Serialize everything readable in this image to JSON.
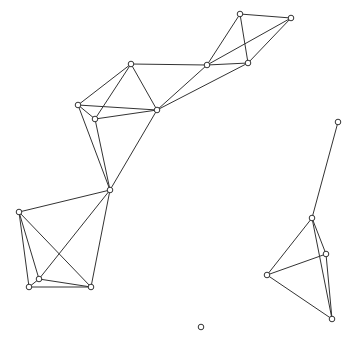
{
  "diagram": {
    "type": "network-graph",
    "colors": {
      "edge": "#333333",
      "node_fill": "#ffffff",
      "node_stroke": "#333333",
      "background": "#ffffff"
    },
    "nodes": [
      {
        "id": 0,
        "x": 240,
        "y": 14
      },
      {
        "id": 1,
        "x": 291,
        "y": 18
      },
      {
        "id": 2,
        "x": 207,
        "y": 65
      },
      {
        "id": 3,
        "x": 248,
        "y": 63
      },
      {
        "id": 4,
        "x": 131,
        "y": 64
      },
      {
        "id": 5,
        "x": 78,
        "y": 105
      },
      {
        "id": 6,
        "x": 95,
        "y": 119
      },
      {
        "id": 7,
        "x": 157,
        "y": 110
      },
      {
        "id": 8,
        "x": 110,
        "y": 190
      },
      {
        "id": 9,
        "x": 19,
        "y": 212
      },
      {
        "id": 10,
        "x": 39,
        "y": 279
      },
      {
        "id": 11,
        "x": 29,
        "y": 287
      },
      {
        "id": 12,
        "x": 91,
        "y": 287
      },
      {
        "id": 13,
        "x": 338,
        "y": 122
      },
      {
        "id": 14,
        "x": 312,
        "y": 218
      },
      {
        "id": 15,
        "x": 326,
        "y": 254
      },
      {
        "id": 16,
        "x": 267,
        "y": 275
      },
      {
        "id": 17,
        "x": 332,
        "y": 319
      },
      {
        "id": 18,
        "x": 201,
        "y": 327
      }
    ],
    "edges": [
      [
        0,
        1
      ],
      [
        0,
        2
      ],
      [
        0,
        3
      ],
      [
        1,
        2
      ],
      [
        1,
        3
      ],
      [
        2,
        3
      ],
      [
        2,
        4
      ],
      [
        2,
        7
      ],
      [
        3,
        7
      ],
      [
        4,
        5
      ],
      [
        4,
        6
      ],
      [
        4,
        7
      ],
      [
        5,
        7
      ],
      [
        6,
        7
      ],
      [
        5,
        6
      ],
      [
        5,
        8
      ],
      [
        6,
        8
      ],
      [
        7,
        8
      ],
      [
        8,
        9
      ],
      [
        8,
        10
      ],
      [
        8,
        12
      ],
      [
        9,
        10
      ],
      [
        9,
        11
      ],
      [
        9,
        12
      ],
      [
        10,
        11
      ],
      [
        10,
        12
      ],
      [
        11,
        12
      ],
      [
        13,
        14
      ],
      [
        14,
        15
      ],
      [
        14,
        16
      ],
      [
        14,
        17
      ],
      [
        15,
        16
      ],
      [
        15,
        17
      ],
      [
        16,
        17
      ]
    ]
  }
}
